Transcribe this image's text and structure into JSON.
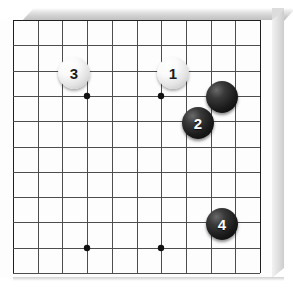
{
  "figure": {
    "kind": "go-board-diagram",
    "title": "",
    "board_size_visible": {
      "columns": 11,
      "rows": 11
    },
    "surface_color": "#fdfdfd",
    "line_color": "#4d4d4d",
    "edge_line_color": "#1f1f1f",
    "board_edge_color": "#cfcfcf",
    "black_stone_color": "#111111",
    "white_stone_color": "#f2f2f2"
  },
  "geometry": {
    "origin_x": 13,
    "origin_y": 20,
    "step_x": 24.7,
    "step_y": 25.3,
    "cols": 11,
    "rows": 11
  },
  "star_points": [
    {
      "name": "star-point-top-left",
      "col": 3,
      "row": 3
    },
    {
      "name": "star-point-top-right",
      "col": 6,
      "row": 3
    },
    {
      "name": "star-point-bottom-left",
      "col": 3,
      "row": 9
    },
    {
      "name": "star-point-bottom-right",
      "col": 6,
      "row": 9
    }
  ],
  "stones": [
    {
      "id": "stone-3",
      "label": "3",
      "color": "white",
      "x": 74,
      "y": 73,
      "radius": 16
    },
    {
      "id": "stone-1",
      "label": "1",
      "color": "white",
      "x": 173,
      "y": 73,
      "radius": 16
    },
    {
      "id": "stone-unnumbered-black",
      "label": "",
      "color": "black",
      "x": 222,
      "y": 97,
      "radius": 16
    },
    {
      "id": "stone-2",
      "label": "2",
      "color": "black",
      "x": 198,
      "y": 123,
      "radius": 16
    },
    {
      "id": "stone-4",
      "label": "4",
      "color": "black",
      "x": 222,
      "y": 224,
      "radius": 16
    }
  ]
}
